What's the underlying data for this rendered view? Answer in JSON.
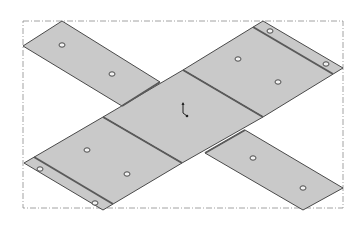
{
  "view": {
    "title": "Sheet metal flat pattern (isometric)",
    "background": "#ffffff",
    "sheet_fill": "#c9c9c9",
    "sheet_stroke": "#4a4a4a",
    "fold_line_color": "#5a5a5a",
    "hole_fill": "#f2f2f2",
    "hole_stroke": "#4a4a4a",
    "bbox_color": "#8a8a8a"
  },
  "bounding_box": {
    "x1": 23,
    "y1": 21,
    "x2": 343,
    "y2": 208,
    "style": "dash-dot"
  },
  "panels": [
    {
      "name": "top-left-strip",
      "points": "62,21 160,82 122,106 23,46"
    },
    {
      "name": "top-right-flange",
      "points": "183,70 263,21 343,68 263,117"
    },
    {
      "name": "center-base",
      "points": "183,70 263,117 182,163 103,117"
    },
    {
      "name": "bottom-left-flange",
      "points": "103,117 182,163 103,210 24,163"
    },
    {
      "name": "bottom-right-strip",
      "points": "245,130 343,188 303,210 205,153"
    }
  ],
  "fold_lines": [
    {
      "name": "fold-center-top-right",
      "x1": 183,
      "y1": 70,
      "x2": 263,
      "y2": 117
    },
    {
      "name": "fold-center-bottom-left",
      "x1": 103,
      "y1": 117,
      "x2": 182,
      "y2": 163
    },
    {
      "name": "fold-center-top-left",
      "x1": 122,
      "y1": 106,
      "x2": 160,
      "y2": 82
    },
    {
      "name": "fold-center-bottom-right",
      "x1": 205,
      "y1": 153,
      "x2": 245,
      "y2": 130
    },
    {
      "name": "hem-top-right",
      "x1": 253,
      "y1": 27,
      "x2": 333,
      "y2": 74
    },
    {
      "name": "hem-bottom-left",
      "x1": 34,
      "y1": 157,
      "x2": 113,
      "y2": 204
    }
  ],
  "holes": [
    {
      "name": "hole-tl-1",
      "cx": 62,
      "cy": 45
    },
    {
      "name": "hole-tl-2",
      "cx": 112,
      "cy": 74
    },
    {
      "name": "hole-tr-1",
      "cx": 238,
      "cy": 59
    },
    {
      "name": "hole-tr-2",
      "cx": 278,
      "cy": 82
    },
    {
      "name": "hole-tr-hem-1",
      "cx": 270,
      "cy": 31
    },
    {
      "name": "hole-tr-hem-2",
      "cx": 326,
      "cy": 64
    },
    {
      "name": "hole-bl-1",
      "cx": 87,
      "cy": 150
    },
    {
      "name": "hole-bl-2",
      "cx": 127,
      "cy": 174
    },
    {
      "name": "hole-bl-hem-1",
      "cx": 40,
      "cy": 169
    },
    {
      "name": "hole-bl-hem-2",
      "cx": 95,
      "cy": 203
    },
    {
      "name": "hole-br-1",
      "cx": 253,
      "cy": 158
    },
    {
      "name": "hole-br-2",
      "cx": 303,
      "cy": 188
    }
  ],
  "origin_triad": {
    "cx": 183,
    "cy": 113
  }
}
